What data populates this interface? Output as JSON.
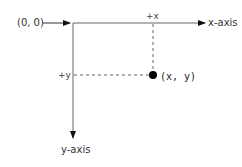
{
  "diagram": {
    "origin_label": "(0, 0)",
    "x_axis_label": "x-axis",
    "y_axis_label": "y-axis",
    "plus_x_label": "+x",
    "plus_y_label": "+y",
    "point_label": "(x, y)",
    "colors": {
      "axis": "#555555",
      "arrow": "#111111",
      "dashed": "#666666",
      "point": "#000000",
      "text": "#333333"
    }
  }
}
